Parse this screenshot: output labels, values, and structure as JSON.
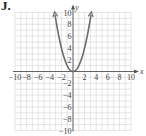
{
  "problem_label": "J.",
  "chart_data": {
    "type": "line",
    "title": "",
    "xlabel": "x",
    "ylabel": "y",
    "xlim": [
      -10,
      10
    ],
    "ylim": [
      -10,
      10
    ],
    "grid": true,
    "x_ticks": [
      "-10",
      "-8",
      "-6",
      "-4",
      "-2",
      "2",
      "4",
      "6",
      "8",
      "10"
    ],
    "y_ticks": [
      "10",
      "8",
      "6",
      "4",
      "2",
      "-2",
      "-4",
      "-6",
      "-8",
      "-10"
    ],
    "series": [
      {
        "name": "y = x^2",
        "color": "#6b6b6b",
        "x": [
          -3.16,
          -3,
          -2.5,
          -2,
          -1.5,
          -1,
          -0.5,
          0,
          0.5,
          1,
          1.5,
          2,
          2.5,
          3,
          3.16
        ],
        "y": [
          10,
          9,
          6.25,
          4,
          2.25,
          1,
          0.25,
          0,
          0.25,
          1,
          2.25,
          4,
          6.25,
          9,
          10
        ],
        "arrows_at_ends": true
      }
    ]
  }
}
